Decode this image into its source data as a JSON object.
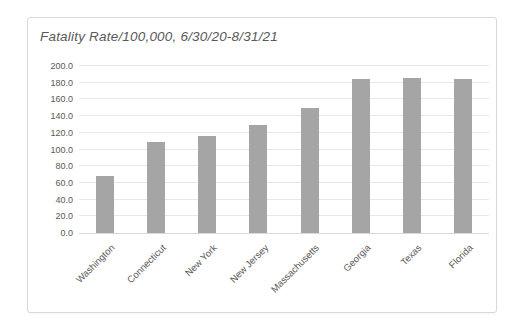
{
  "page": {
    "background_color": "#ffffff"
  },
  "chart_frame": {
    "border_color": "#d9d9d9",
    "fill_color": "#ffffff"
  },
  "chart_data": {
    "type": "bar",
    "title": "Fatality Rate/100,000, 6/30/20-8/31/21",
    "categories": [
      "Washington",
      "Connecticut",
      "New York",
      "New Jersey",
      "Massachusetts",
      "Georgia",
      "Texas",
      "Florida"
    ],
    "values": [
      68,
      109,
      116,
      129,
      150,
      184,
      186,
      185
    ],
    "xlabel": "",
    "ylabel": "",
    "ylim": [
      0,
      200
    ],
    "ytick_step": 20,
    "ytick_decimals": 1,
    "ytick_labels": [
      "0.0",
      "20.0",
      "40.0",
      "60.0",
      "80.0",
      "100.0",
      "120.0",
      "140.0",
      "160.0",
      "180.0",
      "200.0"
    ],
    "grid": true,
    "legend": false,
    "bar_color": "#a5a5a5",
    "gridline_color": "#e8e8e8",
    "axis_line_color": "#d9d9d9",
    "text_color": "#595959",
    "x_label_rotation_deg": 45,
    "title_style": "italic"
  }
}
